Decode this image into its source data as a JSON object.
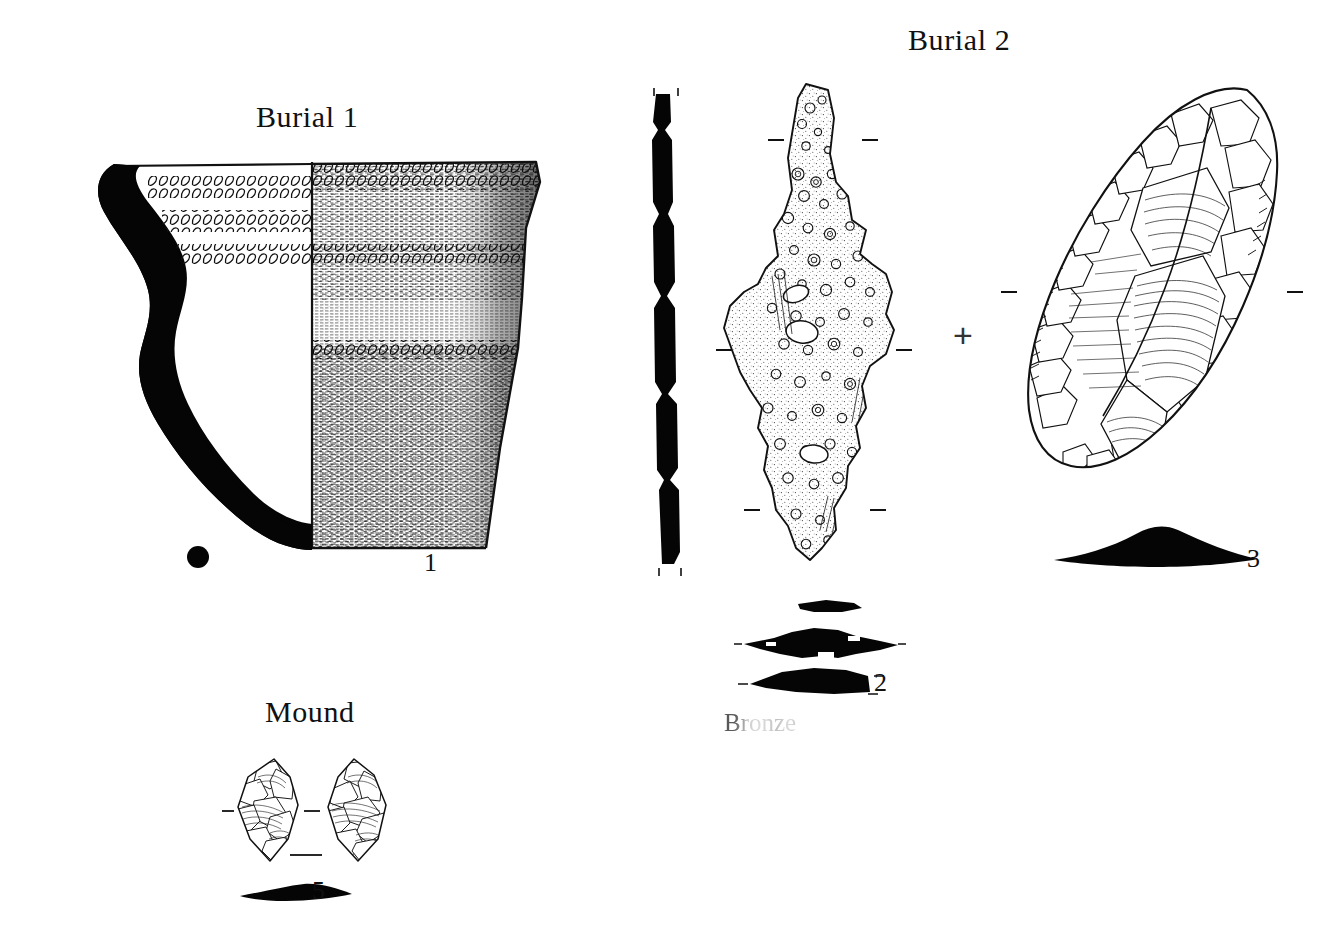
{
  "plate": {
    "background_color": "#ffffff",
    "ink_color": "#111111",
    "width": 1343,
    "height": 945
  },
  "sections": [
    {
      "id": "burial-1",
      "label": "Burial 1"
    },
    {
      "id": "burial-2",
      "label": "Burial 2"
    },
    {
      "id": "mound",
      "label": "Mound"
    }
  ],
  "material_notes": [
    {
      "id": "bronze-note",
      "label": "Bronze"
    }
  ],
  "marks": [
    {
      "id": "registration-plus",
      "glyph": "+"
    }
  ],
  "artifacts": [
    {
      "id": "pottery-vessel",
      "catalog_number": "1",
      "section": "Burial 1",
      "type": "ceramic-vessel-profile",
      "description": "Half-section drawing of a decorated pot; solid black wall profile at left, hatched exterior surface at right",
      "decoration_bands": 3,
      "decoration_motif": "cord-impressed-rows"
    },
    {
      "id": "bronze-object",
      "catalog_number": "2",
      "section": "Burial 2",
      "type": "corroded-bronze-artifact",
      "description": "Heavily corroded bronze blade with nodular encrustation; solid black edge profile at left and three black cross-sections below",
      "cross_sections": 3
    },
    {
      "id": "stone-biface",
      "catalog_number": "3",
      "section": "Burial 2",
      "type": "flaked-stone-tool",
      "description": "Bifacially flaked stone tool drawn with flake-scar hatching; plano-convex black cross-section below",
      "cross_sections": 1
    },
    {
      "id": "small-point",
      "catalog_number": "5",
      "section": "Mound",
      "type": "bifacial-point",
      "description": "Small bifacial point shown obverse and reverse with a thin lenticular black cross-section",
      "views": 2,
      "cross_sections": 1
    }
  ]
}
